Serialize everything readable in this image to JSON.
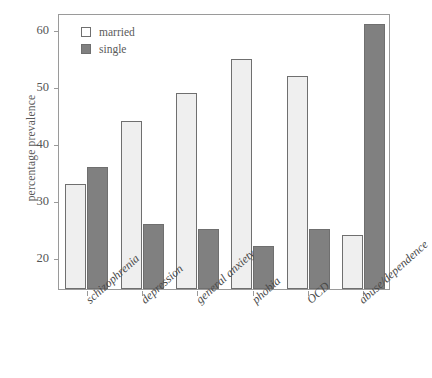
{
  "chart_data": {
    "type": "bar",
    "title": "",
    "xlabel": "",
    "ylabel": "percentage prevalence",
    "categories": [
      "schizophrenia",
      "depression",
      "general anxiety",
      "phobia",
      "OCD",
      "abuse/dependence"
    ],
    "series": [
      {
        "name": "married",
        "values": [
          33,
          44,
          49,
          55,
          52,
          24
        ],
        "color": "#efefef"
      },
      {
        "name": "single",
        "values": [
          36,
          26,
          25,
          22,
          25,
          61
        ],
        "color": "#808080"
      }
    ],
    "ylim": [
      14.5,
      63
    ],
    "yticks": [
      20,
      30,
      40,
      50,
      60
    ],
    "ytick_labels": [
      "20",
      "30",
      "40",
      "50",
      "60"
    ],
    "grid": false,
    "legend_position": "top-left-inside",
    "legend_entries": [
      "married",
      "single"
    ]
  },
  "axis": {
    "y_title": "percentage prevalence"
  }
}
